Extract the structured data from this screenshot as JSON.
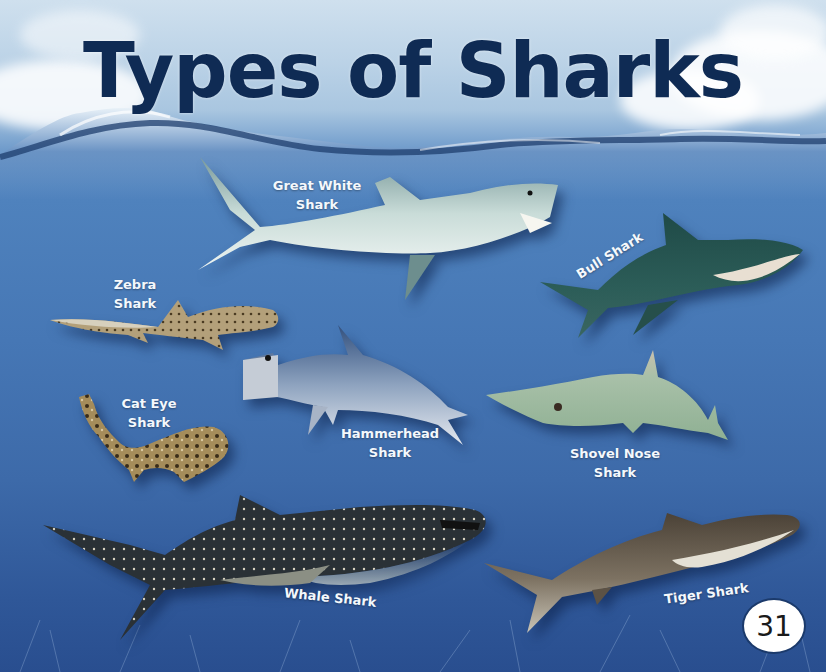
{
  "page": {
    "title": "Types of Sharks",
    "page_number": "31",
    "colors": {
      "title": "#0f2b54",
      "label": "#f4f8fc",
      "water_top": "#4f82bd",
      "water_bottom": "#294e8f",
      "sky": "#bcd3e7"
    }
  },
  "sharks": [
    {
      "name": "great-white",
      "label_line1": "Great White",
      "label_line2": "Shark"
    },
    {
      "name": "bull",
      "label_line1": "Bull Shark",
      "label_line2": ""
    },
    {
      "name": "zebra",
      "label_line1": "Zebra",
      "label_line2": "Shark"
    },
    {
      "name": "hammerhead",
      "label_line1": "Hammerhead",
      "label_line2": "Shark"
    },
    {
      "name": "cat-eye",
      "label_line1": "Cat Eye",
      "label_line2": "Shark"
    },
    {
      "name": "shovel-nose",
      "label_line1": "Shovel Nose",
      "label_line2": "Shark"
    },
    {
      "name": "whale",
      "label_line1": "Whale Shark",
      "label_line2": ""
    },
    {
      "name": "tiger",
      "label_line1": "Tiger Shark",
      "label_line2": ""
    }
  ]
}
